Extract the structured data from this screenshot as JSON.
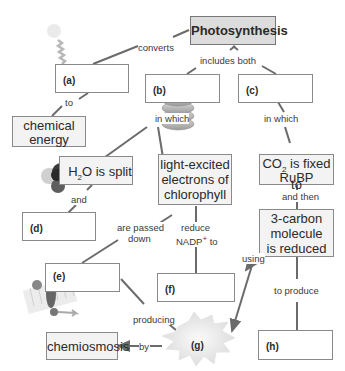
{
  "concept_map": {
    "title": "Photosynthesis",
    "nodes": {
      "a": {
        "label": "(a)"
      },
      "b": {
        "label": "(b)"
      },
      "c": {
        "label": "(c)"
      },
      "d": {
        "label": "(d)"
      },
      "e": {
        "label": "(e)"
      },
      "f": {
        "label": "(f)"
      },
      "g": {
        "label": "(g)"
      },
      "h": {
        "label": "(h)"
      },
      "chemical_energy": {
        "line1": "chemical",
        "line2": "energy"
      },
      "h2o_split": {
        "pre": "H",
        "sub": "2",
        "post": "O is split"
      },
      "light_excited": {
        "line1": "light-excited",
        "line2": "electrons of",
        "line3": "chlorophyll"
      },
      "co2_fixed": {
        "pre": "CO",
        "sub": "2",
        "post": " is fixed to",
        "line2": "RuBP"
      },
      "three_carbon": {
        "line1": "3-carbon",
        "line2": "molecule",
        "line3": "is reduced"
      },
      "chemiosmosis": {
        "text": "chemiosmosis"
      }
    },
    "links": {
      "converts": "converts",
      "to": "to",
      "includes_both": "includes both",
      "in_which_b": "in which",
      "in_which_c": "in which",
      "and": "and",
      "are_passed": "are passed",
      "down": "down",
      "reduce": "reduce",
      "nadp_pre": "NADP",
      "nadp_sup": "+",
      "nadp_post": " to",
      "and_then": "and then",
      "using": "using",
      "to_produce": "to produce",
      "producing": "producing",
      "by": "by"
    },
    "colors": {
      "line": "#6b6b6b",
      "box_border": "#8a8a8a",
      "title_fill": "#dcdcdc"
    }
  }
}
